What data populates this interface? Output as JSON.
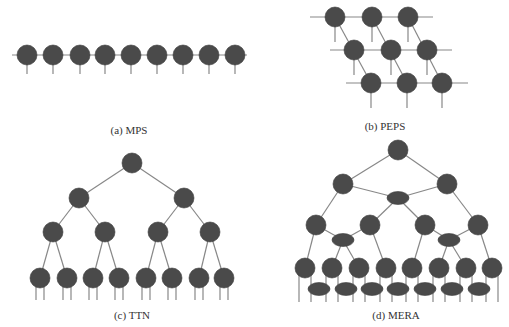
{
  "colors": {
    "node": "#4a4a4a",
    "edge": "#888888",
    "background": "#ffffff"
  },
  "panels": [
    {
      "id": "a",
      "caption": "(a) MPS"
    },
    {
      "id": "b",
      "caption": "(b) PEPS"
    },
    {
      "id": "c",
      "caption": "(c) TTN"
    },
    {
      "id": "d",
      "caption": "(d) MERA"
    }
  ]
}
